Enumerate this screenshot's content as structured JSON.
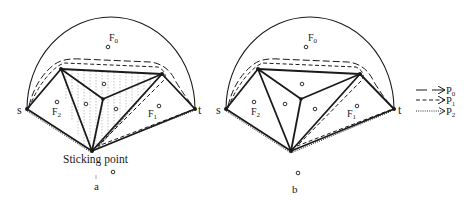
{
  "diagrams": [
    {
      "id": "a",
      "caption": "a",
      "annotation": "Sticking point",
      "labels": {
        "s": "s",
        "t": "t",
        "F0": "F",
        "F0_sub": "0",
        "F1": "F",
        "F1_sub": "1",
        "F2": "F",
        "F2_sub": "2"
      }
    },
    {
      "id": "b",
      "caption": "b",
      "labels": {
        "s": "s",
        "t": "t",
        "F0": "F",
        "F0_sub": "0",
        "F1": "F",
        "F1_sub": "1",
        "F2": "F",
        "F2_sub": "2"
      }
    }
  ],
  "legend": [
    {
      "label": "P",
      "sub": "0",
      "style": "long-dash"
    },
    {
      "label": "P",
      "sub": "1",
      "style": "short-dash"
    },
    {
      "label": "P",
      "sub": "2",
      "style": "dotted"
    }
  ],
  "colors": {
    "ink": "#1a1a1a",
    "background": "#ffffff",
    "hatch": "#9a9a9a"
  }
}
